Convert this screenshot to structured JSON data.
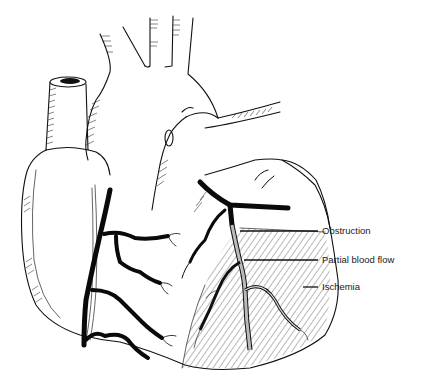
{
  "figure": {
    "style": "black-and-white line art",
    "background": "#ffffff",
    "ink_color": "#111111"
  },
  "labels": [
    {
      "id": "obstruction",
      "text": "Obstruction",
      "x": 322,
      "y": 229
    },
    {
      "id": "partial_blood_flow",
      "text": "Partial blood flow",
      "x": 322,
      "y": 258
    },
    {
      "id": "ischemia",
      "text": "Ischemia",
      "x": 322,
      "y": 285
    }
  ]
}
